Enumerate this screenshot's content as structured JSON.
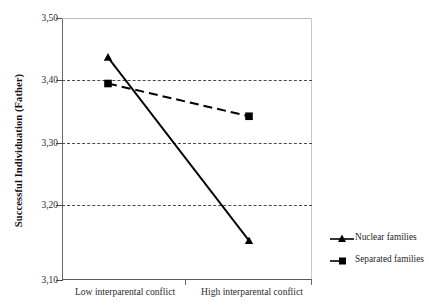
{
  "chart_data": {
    "type": "line",
    "title": "",
    "subtitle": "",
    "xlabel": "",
    "ylabel": "Successful Individuation (Father)",
    "categories": [
      "Low interparental conflict",
      "High interparental conflict"
    ],
    "series": [
      {
        "name": "Nuclear families",
        "values": [
          3.44,
          3.16
        ],
        "marker": "triangle",
        "linestyle": "solid",
        "color": "#000000"
      },
      {
        "name": "Separated families",
        "values": [
          3.4,
          3.35
        ],
        "marker": "square",
        "linestyle": "dashed",
        "color": "#000000"
      }
    ],
    "ylim": [
      3.1,
      3.5
    ],
    "yticks": [
      3.5,
      3.4,
      3.3,
      3.2,
      3.1
    ],
    "ytick_labels": [
      "3,50",
      "3,40",
      "3,30",
      "3,20",
      "3,10"
    ],
    "grid": true,
    "gridlines_at": [
      3.4,
      3.3,
      3.2
    ],
    "legend_position": "right",
    "decimal_separator": ",",
    "background": "#ffffff",
    "axis_color": "#5a5a5a"
  },
  "legend": {
    "entries": [
      {
        "label": "Nuclear families",
        "marker": "triangle-marker",
        "linestyle": "solid"
      },
      {
        "label": "Separated families",
        "marker": "square-marker",
        "linestyle": "solid"
      }
    ]
  }
}
